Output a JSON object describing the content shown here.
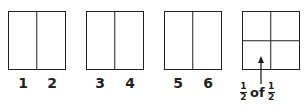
{
  "diagram": {
    "panels": [
      {
        "id": "A",
        "divisions": "vertical-halves",
        "labels": [
          "1",
          "2"
        ]
      },
      {
        "id": "B",
        "divisions": "vertical-halves",
        "labels": [
          "3",
          "4"
        ]
      },
      {
        "id": "C",
        "divisions": "vertical-halves",
        "labels": [
          "5",
          "6"
        ]
      },
      {
        "id": "D",
        "divisions": "quarters",
        "labels": []
      }
    ],
    "annotation": {
      "numerator_1": "1",
      "denominator_1": "2",
      "word": "of",
      "numerator_2": "1",
      "denominator_2": "2",
      "arrow": "up-arrow"
    },
    "colors": {
      "stroke": "#231f20",
      "background": "#ffffff"
    }
  }
}
